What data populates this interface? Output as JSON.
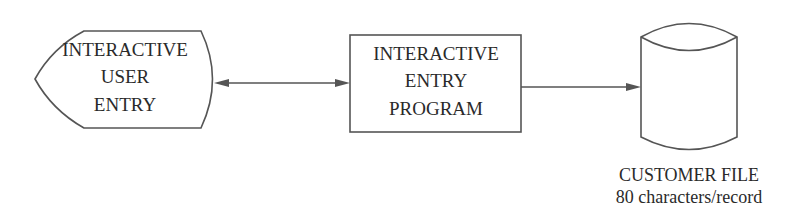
{
  "diagram": {
    "type": "flowchart",
    "nodes": [
      {
        "id": "user_entry",
        "shape": "display",
        "lines": [
          "INTERACTIVE",
          "USER",
          "ENTRY"
        ]
      },
      {
        "id": "entry_program",
        "shape": "process",
        "lines": [
          "INTERACTIVE",
          "ENTRY",
          "PROGRAM"
        ]
      },
      {
        "id": "customer_file",
        "shape": "disk-storage",
        "lines": [],
        "caption": [
          "CUSTOMER FILE",
          "80 characters/record"
        ]
      }
    ],
    "edges": [
      {
        "from": "user_entry",
        "to": "entry_program",
        "direction": "bidirectional"
      },
      {
        "from": "entry_program",
        "to": "customer_file",
        "direction": "forward"
      }
    ]
  },
  "colors": {
    "stroke": "#555555",
    "text": "#2a2a2a",
    "background": "#ffffff"
  }
}
